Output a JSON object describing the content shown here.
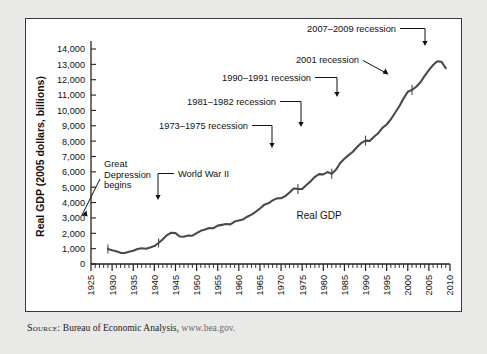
{
  "figure": {
    "source_label": "Source:",
    "source_text": "Bureau of Economic Analysis,",
    "source_url": "www.bea.gov."
  },
  "chart_data": {
    "type": "line",
    "title": "",
    "xlabel": "Year",
    "ylabel": "Real GDP (2005 dollars, billions)",
    "xlim": [
      1925,
      2010
    ],
    "ylim": [
      0,
      14000
    ],
    "grid": false,
    "legend": "none",
    "series_label": "Real GDP",
    "ytick_labels": [
      "0",
      "1,000",
      "2,000",
      "3,000",
      "4,000",
      "5,000",
      "6,000",
      "7,000",
      "8,000",
      "9,000",
      "10,000",
      "11,000",
      "12,000",
      "13,000",
      "14,000"
    ],
    "ytick_values": [
      0,
      1000,
      2000,
      3000,
      4000,
      5000,
      6000,
      7000,
      8000,
      9000,
      10000,
      11000,
      12000,
      13000,
      14000
    ],
    "xtick_labels": [
      "1925",
      "1930",
      "1935",
      "1940",
      "1945",
      "1950",
      "1955",
      "1960",
      "1965",
      "1970",
      "1975",
      "1980",
      "1985",
      "1990",
      "1995",
      "2000",
      "2005",
      "2010"
    ],
    "xtick_values": [
      1925,
      1930,
      1935,
      1940,
      1945,
      1950,
      1955,
      1960,
      1965,
      1970,
      1975,
      1980,
      1985,
      1990,
      1995,
      2000,
      2005,
      2010
    ],
    "xminor_step": 1,
    "series": [
      {
        "name": "Real GDP",
        "x": [
          1929,
          1930,
          1931,
          1932,
          1933,
          1934,
          1935,
          1936,
          1937,
          1938,
          1939,
          1940,
          1941,
          1942,
          1943,
          1944,
          1945,
          1946,
          1947,
          1948,
          1949,
          1950,
          1951,
          1952,
          1953,
          1954,
          1955,
          1956,
          1957,
          1958,
          1959,
          1960,
          1961,
          1962,
          1963,
          1964,
          1965,
          1966,
          1967,
          1968,
          1969,
          1970,
          1971,
          1972,
          1973,
          1974,
          1975,
          1976,
          1977,
          1978,
          1979,
          1980,
          1981,
          1982,
          1983,
          1984,
          1985,
          1986,
          1987,
          1988,
          1989,
          1990,
          1991,
          1992,
          1993,
          1994,
          1995,
          1996,
          1997,
          1998,
          1999,
          2000,
          2001,
          2002,
          2003,
          2004,
          2005,
          2006,
          2007,
          2008,
          2009
        ],
        "values": [
          977,
          893,
          835,
          727,
          716,
          795,
          866,
          979,
          1030,
          995,
          1073,
          1166,
          1366,
          1618,
          1883,
          2035,
          2012,
          1792,
          1776,
          1854,
          1844,
          2006,
          2161,
          2244,
          2347,
          2332,
          2500,
          2549,
          2601,
          2577,
          2762,
          2830,
          2900,
          3080,
          3214,
          3400,
          3617,
          3853,
          3952,
          4142,
          4274,
          4281,
          4419,
          4653,
          4917,
          4890,
          4880,
          5142,
          5378,
          5677,
          5855,
          5839,
          5987,
          5870,
          6137,
          6577,
          6849,
          7087,
          7313,
          7614,
          7885,
          8034,
          8015,
          8288,
          8516,
          8863,
          9086,
          9426,
          9846,
          10275,
          10770,
          11216,
          11338,
          11543,
          11836,
          12247,
          12623,
          12959,
          13206,
          13162,
          12758
        ]
      }
    ],
    "annotations": [
      {
        "id": "great-depression",
        "text_lines": [
          "Great",
          "Depression",
          "begins"
        ],
        "points_to_year": 1929
      },
      {
        "id": "world-war-ii",
        "text_lines": [
          "World War II"
        ],
        "points_to_year": 1941
      },
      {
        "id": "recession-1973-1975",
        "text_lines": [
          "1973–1975 recession"
        ],
        "points_to_year": 1974
      },
      {
        "id": "recession-1981-1982",
        "text_lines": [
          "1981–1982 recession"
        ],
        "points_to_year": 1982
      },
      {
        "id": "recession-1990-1991",
        "text_lines": [
          "1990–1991 recession"
        ],
        "points_to_year": 1990
      },
      {
        "id": "recession-2001",
        "text_lines": [
          "2001 recession"
        ],
        "points_to_year": 2001
      },
      {
        "id": "recession-2007-2009",
        "text_lines": [
          "2007–2009 recession"
        ],
        "points_to_year": 2008
      }
    ]
  }
}
